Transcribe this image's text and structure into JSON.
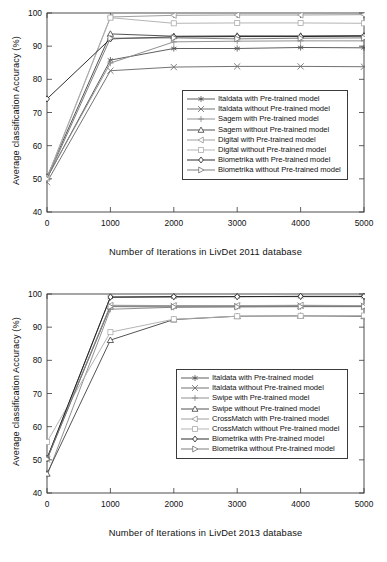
{
  "figure": {
    "panels": [
      {
        "id": "livdet-2011",
        "ylabel": "Average classification Accuracy (%)",
        "xlabel": "Number of Iterations in LivDet 2011 database",
        "yticks": [
          "40",
          "50",
          "60",
          "70",
          "80",
          "90",
          "100"
        ],
        "xticks": [
          "0",
          "1000",
          "2000",
          "3000",
          "4000",
          "5000"
        ],
        "legend": [
          "Italdata with Pre-trained model",
          "Italdata without Pre-trained model",
          "Sagem with Pre-trained model",
          "Sagem without Pre-trained model",
          "Digital with Pre-trained model",
          "Digital without Pre-trained model",
          "Biometrika with Pre-trained model",
          "Biometrika without Pre-trained model"
        ]
      },
      {
        "id": "livdet-2013",
        "ylabel": "Average classification Accuracy (%)",
        "xlabel": "Number of Iterations in LivDet 2013 database",
        "yticks": [
          "40",
          "50",
          "60",
          "70",
          "80",
          "90",
          "100"
        ],
        "xticks": [
          "0",
          "1000",
          "2000",
          "3000",
          "4000",
          "5000"
        ],
        "legend": [
          "Italdata with Pre-trained model",
          "Italdata without Pre-trained model",
          "Swipe with Pre-trained model",
          "Swipe without Pre-trained model",
          "CrossMatch with Pre-trained model",
          "CrossMatch without Pre-trained model",
          "Biometrika with Pre-trained model",
          "Biometrika without Pre-trained model"
        ]
      }
    ]
  },
  "chart_data": [
    {
      "type": "line",
      "id": "livdet-2011",
      "title": "",
      "xlabel": "Number of Iterations in LivDet 2011 database",
      "ylabel": "Average classification Accuracy (%)",
      "xlim": [
        0,
        5000
      ],
      "ylim": [
        40,
        100
      ],
      "xticks": [
        0,
        1000,
        2000,
        3000,
        4000,
        5000
      ],
      "yticks": [
        40,
        50,
        60,
        70,
        80,
        90,
        100
      ],
      "grid": false,
      "legend_position": "center-right",
      "x": [
        0,
        1000,
        2000,
        3000,
        4000,
        5000
      ],
      "series": [
        {
          "name": "Italdata with Pre-trained model",
          "marker": "asterisk",
          "color": "#555555",
          "values": [
            50.2,
            85.8,
            89.3,
            89.3,
            89.6,
            89.5
          ]
        },
        {
          "name": "Italdata without Pre-trained model",
          "marker": "x",
          "color": "#6a6a6a",
          "values": [
            49.0,
            82.6,
            83.7,
            83.9,
            83.9,
            83.8
          ]
        },
        {
          "name": "Sagem with Pre-trained model",
          "marker": "plus",
          "color": "#8a8a8a",
          "values": [
            50.4,
            84.9,
            91.3,
            91.5,
            91.6,
            91.6
          ]
        },
        {
          "name": "Sagem without Pre-trained model",
          "marker": "triangle",
          "color": "#4a4a4a",
          "values": [
            50.6,
            93.7,
            93.0,
            93.1,
            93.1,
            93.2
          ]
        },
        {
          "name": "Digital with Pre-trained model",
          "marker": "triangle-left",
          "color": "#9a9a9a",
          "values": [
            50.3,
            98.8,
            99.3,
            99.4,
            99.4,
            99.5
          ]
        },
        {
          "name": "Digital without Pre-trained model",
          "marker": "square",
          "color": "#b0b0b0",
          "values": [
            50.1,
            98.6,
            96.9,
            97.0,
            97.0,
            96.9
          ]
        },
        {
          "name": "Biometrika with Pre-trained model",
          "marker": "diamond",
          "color": "#222222",
          "values": [
            74.1,
            92.2,
            92.8,
            92.9,
            92.9,
            93.0
          ]
        },
        {
          "name": "Biometrika without Pre-trained model",
          "marker": "triangle-right",
          "color": "#777777",
          "values": [
            50.0,
            92.4,
            92.5,
            92.2,
            92.4,
            92.5
          ]
        }
      ]
    },
    {
      "type": "line",
      "id": "livdet-2013",
      "title": "",
      "xlabel": "Number of Iterations in LivDet 2013 database",
      "ylabel": "Average classification Accuracy (%)",
      "xlim": [
        0,
        5000
      ],
      "ylim": [
        40,
        100
      ],
      "xticks": [
        0,
        1000,
        2000,
        3000,
        4000,
        5000
      ],
      "yticks": [
        40,
        50,
        60,
        70,
        80,
        90,
        100
      ],
      "grid": false,
      "legend_position": "center-right",
      "x": [
        0,
        1000,
        2000,
        3000,
        4000,
        5000
      ],
      "series": [
        {
          "name": "Italdata with Pre-trained model",
          "marker": "asterisk",
          "color": "#555555",
          "values": [
            50.3,
            99.0,
            99.1,
            99.2,
            99.2,
            99.2
          ]
        },
        {
          "name": "Italdata without Pre-trained model",
          "marker": "x",
          "color": "#6a6a6a",
          "values": [
            50.1,
            96.4,
            96.4,
            96.4,
            96.5,
            96.4
          ]
        },
        {
          "name": "Swipe with Pre-trained model",
          "marker": "plus",
          "color": "#8a8a8a",
          "values": [
            45.2,
            95.4,
            96.0,
            96.2,
            96.2,
            96.2
          ]
        },
        {
          "name": "Swipe without Pre-trained model",
          "marker": "triangle",
          "color": "#4a4a4a",
          "values": [
            45.8,
            86.1,
            92.3,
            93.3,
            93.4,
            93.3
          ]
        },
        {
          "name": "CrossMatch with Pre-trained model",
          "marker": "triangle-left",
          "color": "#9a9a9a",
          "values": [
            50.5,
            96.6,
            96.5,
            96.5,
            96.6,
            96.5
          ]
        },
        {
          "name": "CrossMatch without Pre-trained model",
          "marker": "square",
          "color": "#b0b0b0",
          "values": [
            55.4,
            88.5,
            92.4,
            93.3,
            93.4,
            93.5
          ]
        },
        {
          "name": "Biometrika with Pre-trained model",
          "marker": "diamond",
          "color": "#222222",
          "values": [
            50.4,
            99.1,
            99.2,
            99.2,
            99.3,
            99.3
          ]
        },
        {
          "name": "Biometrika without Pre-trained model",
          "marker": "triangle-right",
          "color": "#777777",
          "values": [
            50.2,
            96.2,
            96.1,
            96.1,
            96.2,
            96.2
          ]
        }
      ]
    }
  ]
}
